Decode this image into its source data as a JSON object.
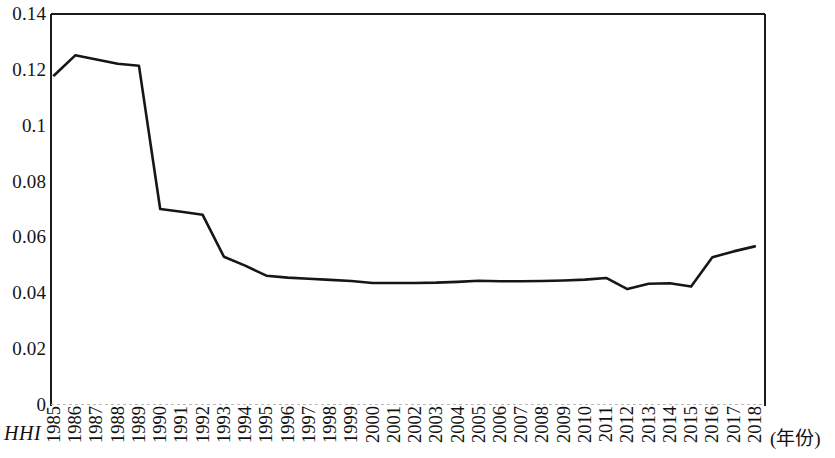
{
  "figure": {
    "background_color": "#ffffff",
    "axis_color": "#1a1a1a",
    "line_color": "#161616"
  },
  "axes": {
    "y_label": "HHI",
    "x_caption": "(年份)",
    "y_ticks": [
      "0.14",
      "0.12",
      "0.1",
      "0.08",
      "0.06",
      "0.04",
      "0.02",
      "0"
    ]
  },
  "chart_data": {
    "type": "line",
    "title": "",
    "xlabel": "(年份)",
    "ylabel": "HHI",
    "ylim": [
      0,
      0.14
    ],
    "ytick_values": [
      0.14,
      0.12,
      0.1,
      0.08,
      0.06,
      0.04,
      0.02,
      0
    ],
    "grid": false,
    "legend": null,
    "markers": false,
    "line_color": "#161616",
    "line_width": 2.6,
    "categories": [
      "1985",
      "1986",
      "1987",
      "1988",
      "1989",
      "1990",
      "1991",
      "1992",
      "1993",
      "1994",
      "1995",
      "1996",
      "1997",
      "1998",
      "1999",
      "2000",
      "2001",
      "2002",
      "2003",
      "2004",
      "2005",
      "2006",
      "2007",
      "2008",
      "2009",
      "2010",
      "2011",
      "2012",
      "2013",
      "2014",
      "2015",
      "2016",
      "2017",
      "2018"
    ],
    "series": [
      {
        "name": "HHI",
        "values": [
          0.118,
          0.1252,
          0.1237,
          0.1222,
          0.1215,
          0.0702,
          0.0692,
          0.0681,
          0.0531,
          0.0499,
          0.0463,
          0.0456,
          0.0452,
          0.0448,
          0.0444,
          0.0437,
          0.0437,
          0.0437,
          0.0438,
          0.0441,
          0.0445,
          0.0443,
          0.0443,
          0.0444,
          0.0446,
          0.0449,
          0.0455,
          0.0415,
          0.0434,
          0.0436,
          0.0424,
          0.0529,
          0.055,
          0.0568
        ]
      }
    ]
  }
}
